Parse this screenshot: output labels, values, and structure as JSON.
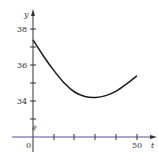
{
  "chart_data": {
    "type": "line",
    "title": "",
    "xlabel": "t",
    "ylabel": "y",
    "xlim": [
      0,
      50
    ],
    "ylim": [
      33,
      38.5
    ],
    "x_ticks": [
      10,
      20,
      30,
      40,
      50
    ],
    "x_tick_labels": [
      "0",
      "50"
    ],
    "y_ticks": [
      33,
      34,
      35,
      36,
      37,
      38
    ],
    "y_tick_labels": [
      "34",
      "36",
      "38"
    ],
    "axis_break_mark": true,
    "grid": false,
    "legend": null,
    "series": [
      {
        "name": "y(t)",
        "color": "#1a1a1a",
        "x": [
          0,
          5,
          10,
          15,
          20,
          25,
          30,
          35,
          40,
          45,
          50
        ],
        "values": [
          37.4,
          36.5,
          35.7,
          35.0,
          34.5,
          34.25,
          34.2,
          34.3,
          34.55,
          34.95,
          35.4
        ]
      }
    ],
    "axis_color": "#333333",
    "x_axis_color": "#5a4fa0"
  },
  "labels": {
    "y_axis": "y",
    "x_axis": "t",
    "origin": "0",
    "x_50": "50",
    "y_34": "34",
    "y_36": "36",
    "y_38": "38",
    "break_mark": "≈"
  }
}
